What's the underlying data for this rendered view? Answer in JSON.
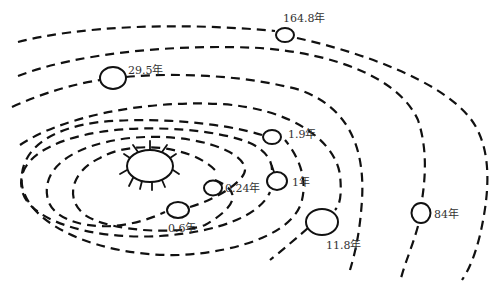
{
  "diagram": {
    "title": "",
    "type": "solar-system-orbits",
    "sun": {
      "label": "",
      "icon": "sun-icon"
    },
    "planets": [
      {
        "id": "mercury",
        "period_label": "0.24年"
      },
      {
        "id": "venus",
        "period_label": "0.6年"
      },
      {
        "id": "earth",
        "period_label": "1年"
      },
      {
        "id": "mars",
        "period_label": "1.9年"
      },
      {
        "id": "jupiter",
        "period_label": "11.8年"
      },
      {
        "id": "saturn",
        "period_label": "29.5年"
      },
      {
        "id": "uranus",
        "period_label": "84年"
      },
      {
        "id": "neptune",
        "period_label": "164.8年"
      }
    ],
    "colors": {
      "line": "#111111",
      "text": "#333333",
      "background": "#ffffff"
    }
  }
}
